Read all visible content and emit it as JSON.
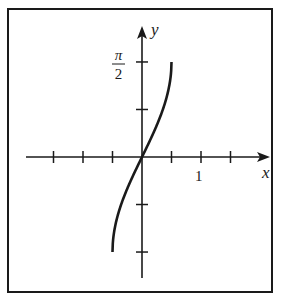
{
  "chart_data": {
    "type": "line",
    "title": "",
    "xlabel": "x",
    "ylabel": "y",
    "x_tick_labels": [
      {
        "value": 1,
        "label": "1"
      }
    ],
    "y_tick_labels": [
      {
        "value": 1.5708,
        "label": "π/2",
        "numerator": "π",
        "denominator": "2"
      }
    ],
    "x_ticks": [
      -1.5,
      -1.0,
      -0.5,
      0.5,
      1.0,
      1.5
    ],
    "y_ticks": [
      -1.5708,
      -0.7854,
      0.7854,
      1.5708
    ],
    "xlim": [
      -1.95,
      2.15
    ],
    "ylim": [
      -2.0,
      2.0
    ],
    "grid": false,
    "legend": null,
    "series": [
      {
        "name": "y = arcsin(2x)",
        "x": [
          -0.5,
          -0.45,
          -0.4,
          -0.3,
          -0.2,
          -0.1,
          0,
          0.1,
          0.2,
          0.3,
          0.4,
          0.45,
          0.5
        ],
        "y": [
          -1.5708,
          -1.1198,
          -0.9273,
          -0.6435,
          -0.4115,
          -0.2014,
          0,
          0.2014,
          0.4115,
          0.6435,
          0.9273,
          1.1198,
          1.5708
        ]
      }
    ]
  },
  "labels": {
    "x_axis": "x",
    "y_axis": "y",
    "x_tick_one": "1",
    "y_tick_num": "π",
    "y_tick_den": "2"
  }
}
